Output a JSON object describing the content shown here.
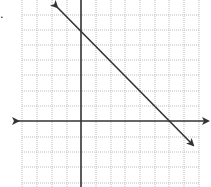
{
  "problem": {
    "label_text": "."
  },
  "graph": {
    "grid": {
      "x_lines_px": [
        22,
        37,
        52,
        67,
        96,
        111,
        125,
        140,
        155,
        169,
        184,
        199
      ],
      "y_lines_px": [
        15,
        30,
        45,
        60,
        75,
        91,
        106,
        137,
        152,
        167,
        183
      ],
      "left": 22,
      "right": 199,
      "top": 0,
      "bottom": 187,
      "color": "#bdbdbd",
      "style": "dotted"
    },
    "axes": {
      "origin_px": [
        81,
        121
      ],
      "x_axis": {
        "from": 12,
        "to": 210,
        "arrows": "both"
      },
      "y_axis": {
        "from": 0,
        "to": 187,
        "arrows": "none"
      },
      "color": "#333333"
    },
    "line": {
      "equation": "y = -x + 6",
      "slope": -1,
      "y_intercept": 6,
      "x_intercept": 6,
      "start_px": [
        53,
        3
      ],
      "end_px": [
        197,
        149
      ],
      "arrows": "both",
      "color": "#333333"
    }
  }
}
